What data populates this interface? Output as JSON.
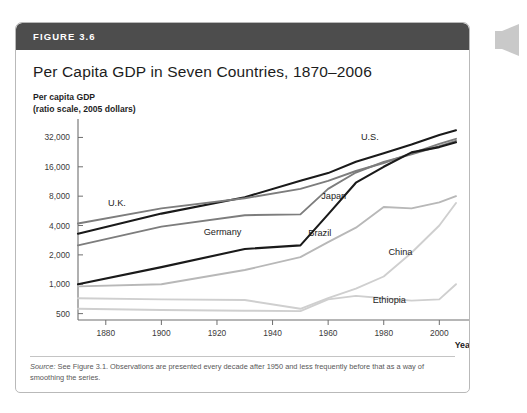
{
  "figure": {
    "number_label": "FIGURE 3.6",
    "title": "Per Capita GDP in Seven Countries, 1870–2006",
    "axis_caption_line1": "Per capita GDP",
    "axis_caption_line2": "(ratio scale, 2005 dollars)",
    "source_prefix": "Source:",
    "source_text": " See Figure 3.1. Observations are presented every decade after 1950 and less frequently before that as a way of smoothing the series."
  },
  "colors": {
    "header_bar": "#4d4d4d",
    "card_border": "#b9b9b9",
    "dark_line": "#1a1a1a",
    "mid_line": "#7d7d7d",
    "light_line": "#b8b8b8",
    "pale_line": "#cfcfcf",
    "axis": "#6f6f6f",
    "tick_text": "#3b3b3b"
  },
  "chart_data": {
    "type": "line",
    "title": "Per Capita GDP in Seven Countries, 1870–2006",
    "xlabel": "Year",
    "ylabel": "Per capita GDP (ratio scale, 2005 dollars)",
    "scale": "log",
    "grid": false,
    "legend_position": "inline-labels",
    "xlim": [
      1870,
      2006
    ],
    "ylim": [
      430,
      45000
    ],
    "ytick_values": [
      500,
      1000,
      2000,
      4000,
      8000,
      16000,
      32000
    ],
    "ytick_labels": [
      "500",
      "1,000",
      "2,000",
      "4,000",
      "8,000",
      "16,000",
      "32,000"
    ],
    "xtick_values": [
      1880,
      1900,
      1920,
      1940,
      1960,
      1980,
      2000
    ],
    "xtick_labels": [
      "1880",
      "1900",
      "1920",
      "1940",
      "1960",
      "1980",
      "2000"
    ],
    "series": [
      {
        "name": "U.S.",
        "shade": "dark",
        "label_x": 1975,
        "label_y": 30000,
        "x": [
          1870,
          1900,
          1930,
          1950,
          1960,
          1970,
          1980,
          1990,
          2000,
          2006
        ],
        "y": [
          3300,
          5300,
          7800,
          11500,
          13800,
          18000,
          22000,
          27000,
          34000,
          38000
        ]
      },
      {
        "name": "U.K.",
        "shade": "mid",
        "label_x": 1884,
        "label_y": 6400,
        "x": [
          1870,
          1900,
          1930,
          1950,
          1960,
          1970,
          1980,
          1990,
          2000,
          2006
        ],
        "y": [
          4200,
          6000,
          7600,
          9500,
          11500,
          14500,
          17500,
          22000,
          27500,
          31000
        ]
      },
      {
        "name": "Germany",
        "shade": "mid",
        "label_x": 1922,
        "label_y": 3200,
        "x": [
          1870,
          1900,
          1930,
          1950,
          1960,
          1970,
          1980,
          1990,
          2000,
          2006
        ],
        "y": [
          2500,
          3900,
          5100,
          5200,
          9500,
          14000,
          18000,
          21500,
          26000,
          29500
        ]
      },
      {
        "name": "Japan",
        "shade": "dark",
        "label_x": 1962,
        "label_y": 7400,
        "x": [
          1870,
          1900,
          1930,
          1950,
          1960,
          1970,
          1980,
          1990,
          2000,
          2006
        ],
        "y": [
          1000,
          1500,
          2300,
          2500,
          5200,
          11000,
          16000,
          22500,
          25500,
          28500
        ]
      },
      {
        "name": "Brazil",
        "shade": "mid-light",
        "label_x": 1957,
        "label_y": 3100,
        "x": [
          1870,
          1900,
          1930,
          1950,
          1960,
          1970,
          1980,
          1990,
          2000,
          2006
        ],
        "y": [
          950,
          1000,
          1400,
          1900,
          2700,
          3800,
          6200,
          6000,
          6900,
          8000
        ]
      },
      {
        "name": "China",
        "shade": "light",
        "label_x": 1986,
        "label_y": 2000,
        "x": [
          1870,
          1900,
          1930,
          1950,
          1960,
          1970,
          1980,
          1990,
          2000,
          2006
        ],
        "y": [
          720,
          700,
          690,
          560,
          720,
          900,
          1200,
          2100,
          4000,
          6800
        ]
      },
      {
        "name": "Ethiopia",
        "shade": "light",
        "label_x": 1982,
        "label_y": 640,
        "x": [
          1870,
          1900,
          1930,
          1950,
          1960,
          1970,
          1980,
          1990,
          2000,
          2006
        ],
        "y": [
          560,
          545,
          535,
          530,
          700,
          760,
          720,
          680,
          700,
          1000
        ]
      }
    ]
  }
}
